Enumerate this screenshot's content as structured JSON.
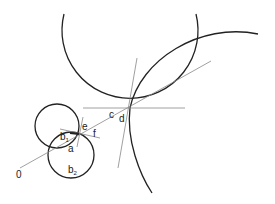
{
  "diagram": {
    "type": "geometric construction",
    "labels": {
      "origin": "0",
      "a": "a",
      "b1": "b",
      "b1_sub": "1",
      "b2": "b",
      "b2_sub": "2",
      "c": "c",
      "d": "d",
      "e": "e",
      "f": "f"
    },
    "colors": {
      "stroke": "#222222",
      "thin_line": "#888888",
      "background": "#ffffff"
    }
  }
}
